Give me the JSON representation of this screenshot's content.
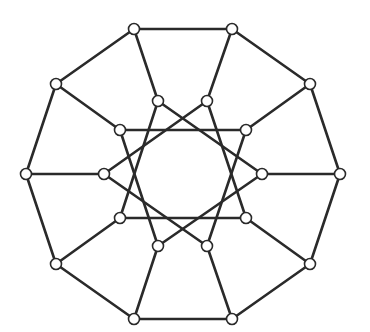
{
  "diagram": {
    "type": "graph",
    "node_radius": 5.5,
    "colors": {
      "edge": "#2a2a2a",
      "node_fill": "#ffffff",
      "node_stroke": "#2a2a2a",
      "background": "#ffffff"
    },
    "outer_nodes": [
      {
        "id": "o0",
        "x": 134,
        "y": 29
      },
      {
        "id": "o1",
        "x": 232,
        "y": 29
      },
      {
        "id": "o2",
        "x": 310,
        "y": 84
      },
      {
        "id": "o3",
        "x": 340,
        "y": 174
      },
      {
        "id": "o4",
        "x": 310,
        "y": 264
      },
      {
        "id": "o5",
        "x": 232,
        "y": 319
      },
      {
        "id": "o6",
        "x": 134,
        "y": 319
      },
      {
        "id": "o7",
        "x": 56,
        "y": 264
      },
      {
        "id": "o8",
        "x": 26,
        "y": 174
      },
      {
        "id": "o9",
        "x": 56,
        "y": 84
      }
    ],
    "inner_nodes": [
      {
        "id": "i0",
        "x": 158,
        "y": 101
      },
      {
        "id": "i1",
        "x": 207,
        "y": 101
      },
      {
        "id": "i2",
        "x": 246,
        "y": 130
      },
      {
        "id": "i3",
        "x": 262,
        "y": 174
      },
      {
        "id": "i4",
        "x": 246,
        "y": 218
      },
      {
        "id": "i5",
        "x": 207,
        "y": 246
      },
      {
        "id": "i6",
        "x": 158,
        "y": 246
      },
      {
        "id": "i7",
        "x": 120,
        "y": 218
      },
      {
        "id": "i8",
        "x": 104,
        "y": 174
      },
      {
        "id": "i9",
        "x": 120,
        "y": 130
      }
    ],
    "edges": [
      [
        "o0",
        "o1"
      ],
      [
        "o1",
        "o2"
      ],
      [
        "o2",
        "o3"
      ],
      [
        "o3",
        "o4"
      ],
      [
        "o4",
        "o5"
      ],
      [
        "o5",
        "o6"
      ],
      [
        "o6",
        "o7"
      ],
      [
        "o7",
        "o8"
      ],
      [
        "o8",
        "o9"
      ],
      [
        "o9",
        "o0"
      ],
      [
        "o0",
        "i0"
      ],
      [
        "o1",
        "i1"
      ],
      [
        "o2",
        "i2"
      ],
      [
        "o3",
        "i3"
      ],
      [
        "o4",
        "i4"
      ],
      [
        "o5",
        "i5"
      ],
      [
        "o6",
        "i6"
      ],
      [
        "o7",
        "i7"
      ],
      [
        "o8",
        "i8"
      ],
      [
        "o9",
        "i9"
      ],
      [
        "i0",
        "i3"
      ],
      [
        "i1",
        "i4"
      ],
      [
        "i2",
        "i5"
      ],
      [
        "i3",
        "i6"
      ],
      [
        "i4",
        "i7"
      ],
      [
        "i5",
        "i8"
      ],
      [
        "i6",
        "i9"
      ],
      [
        "i7",
        "i0"
      ],
      [
        "i8",
        "i1"
      ],
      [
        "i9",
        "i2"
      ]
    ]
  }
}
